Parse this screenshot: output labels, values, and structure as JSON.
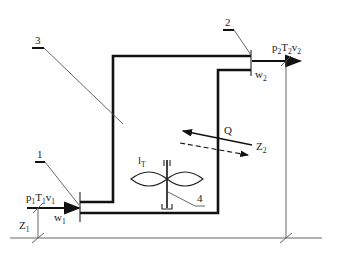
{
  "diagram": {
    "type": "open thermodynamic system (control volume) schematic",
    "callouts": [
      {
        "id": "1",
        "label": "1",
        "refers_to": "inlet section"
      },
      {
        "id": "2",
        "label": "2",
        "refers_to": "outlet section"
      },
      {
        "id": "3",
        "label": "3",
        "refers_to": "vessel / control volume"
      },
      {
        "id": "4",
        "label": "4",
        "refers_to": "shaft / impeller"
      }
    ],
    "inlet": {
      "state": {
        "p": "p",
        "p_sub": "1",
        "T": "T",
        "T_sub": "1",
        "v": "v",
        "v_sub": "1"
      },
      "velocity": {
        "w": "w",
        "w_sub": "1"
      },
      "height": {
        "z": "Z",
        "z_sub": "1"
      }
    },
    "outlet": {
      "state": {
        "p": "p",
        "p_sub": "2",
        "T": "T",
        "T_sub": "2",
        "v": "v",
        "v_sub": "2"
      },
      "velocity": {
        "w": "w",
        "w_sub": "2"
      },
      "height": {
        "z": "Z",
        "z_sub": "2"
      }
    },
    "heat": {
      "label": "Q"
    },
    "work": {
      "l": "l",
      "l_sub": "T"
    }
  }
}
